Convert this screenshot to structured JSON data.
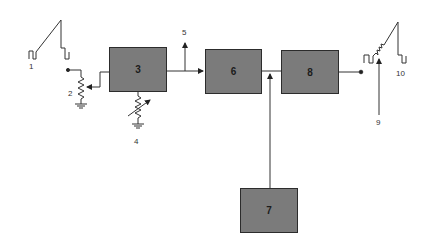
{
  "diagram": {
    "type": "block-diagram",
    "background": "#ffffff",
    "block_color": "#7b7b7b",
    "line_color": "#333333",
    "blocks": [
      {
        "id": "3",
        "label": "3",
        "x": 109,
        "y": 47,
        "w": 58,
        "h": 45
      },
      {
        "id": "6",
        "label": "6",
        "x": 205,
        "y": 49,
        "w": 57,
        "h": 45
      },
      {
        "id": "8",
        "label": "8",
        "x": 281,
        "y": 50,
        "w": 58,
        "h": 44
      },
      {
        "id": "7",
        "label": "7",
        "x": 240,
        "y": 188,
        "w": 58,
        "h": 45
      }
    ],
    "labels": {
      "l1": "1",
      "l2": "2",
      "l4": "4",
      "l5": "5",
      "l9": "9",
      "l10": "10"
    },
    "components": [
      {
        "id": "1",
        "kind": "input-waveform-sawtooth-with-pulses"
      },
      {
        "id": "2",
        "kind": "potentiometer-to-ground"
      },
      {
        "id": "4",
        "kind": "variable-resistor-to-ground"
      },
      {
        "id": "5",
        "kind": "output-arrow"
      },
      {
        "id": "9",
        "kind": "arrow-pointing-to-waveform"
      },
      {
        "id": "10",
        "kind": "output-waveform-sawtooth-with-pulses"
      }
    ],
    "connections": [
      {
        "from": "3",
        "to": "6"
      },
      {
        "from": "3",
        "to": "5"
      },
      {
        "from": "6",
        "to": "8"
      },
      {
        "from": "7",
        "to": "6-8-junction"
      },
      {
        "from": "8",
        "to": "10"
      },
      {
        "from": "3",
        "to": "2-wiper"
      },
      {
        "from": "3",
        "to": "4"
      }
    ]
  }
}
